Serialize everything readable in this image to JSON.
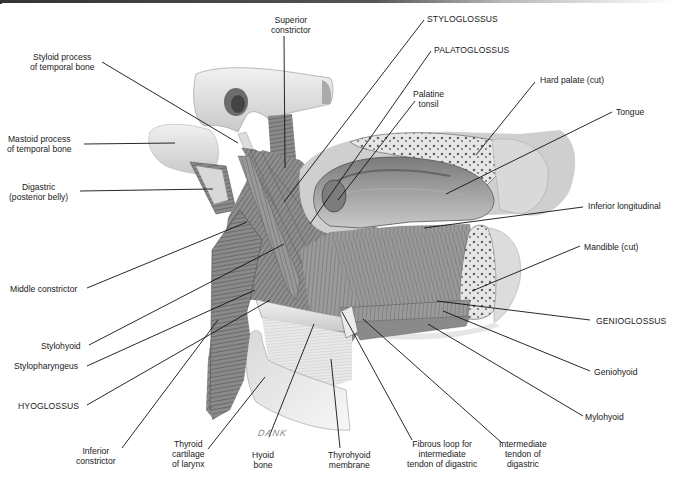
{
  "figure": {
    "artist_signature": "DANK"
  },
  "labels": {
    "superior_constrictor": [
      "Superior",
      "constrictor"
    ],
    "styloglossus": "STYLOGLOSSUS",
    "palatoglossus": "PALATOGLOSSUS",
    "styloid_process": [
      "Styloid process",
      "of temporal bone"
    ],
    "palatine_tonsil": [
      "Palatine",
      "tonsil"
    ],
    "hard_palate": "Hard palate (cut)",
    "tongue": "Tongue",
    "mastoid_process": [
      "Mastoid process",
      "of temporal bone"
    ],
    "digastric_posterior": [
      "Digastric",
      "(posterior belly)"
    ],
    "inferior_longitudinal": "Inferior longitudinal",
    "mandible": "Mandible (cut)",
    "middle_constrictor": "Middle constrictor",
    "genioglossus": "GENIOGLOSSUS",
    "stylohyoid": "Stylohyoid",
    "stylopharyngeus": "Stylopharyngeus",
    "geniohyoid": "Geniohyoid",
    "hyoglossus": "HYOGLOSSUS",
    "mylohyoid": "Mylohyoid",
    "inferior_constrictor": [
      "Inferior",
      "constrictor"
    ],
    "thyroid_cartilage": [
      "Thyroid",
      "cartilage",
      "of larynx"
    ],
    "hyoid_bone": [
      "Hyoid",
      "bone"
    ],
    "thyrohyoid_membrane": [
      "Thyrohyoid",
      "membrane"
    ],
    "fibrous_loop": [
      "Fibrous loop for",
      "intermediate",
      "tendon of digastric"
    ],
    "intermediate_tendon": [
      "Intermediate",
      "tendon of",
      "digastric"
    ]
  },
  "colors": {
    "background": "#ffffff",
    "bone": "#e4e4e4",
    "muscle": "#8a8a8a",
    "muscle_dark": "#5e5e5e",
    "leader_line": "#111111"
  }
}
